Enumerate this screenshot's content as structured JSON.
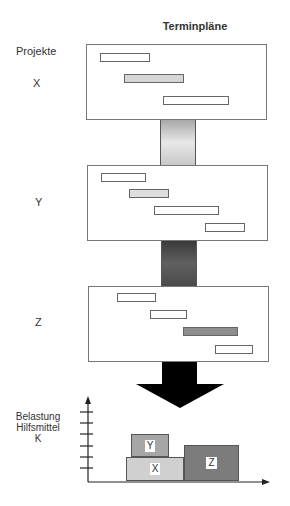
{
  "title": "Terminpläne",
  "projects_label": "Projekte",
  "projects": [
    {
      "name": "X",
      "panel": {
        "x": 86,
        "y": 44,
        "w": 181,
        "h": 76
      },
      "label_pos": {
        "x": 33,
        "y": 77
      },
      "bars": [
        {
          "x": 100,
          "y": 53,
          "w": 50,
          "fill": "#ffffff"
        },
        {
          "x": 124,
          "y": 74,
          "w": 60,
          "fill": "#d6d6d6"
        },
        {
          "x": 163,
          "y": 96,
          "w": 66,
          "fill": "#ffffff"
        }
      ]
    },
    {
      "name": "Y",
      "panel": {
        "x": 87,
        "y": 165,
        "w": 181,
        "h": 76
      },
      "label_pos": {
        "x": 35,
        "y": 196
      },
      "bars": [
        {
          "x": 101,
          "y": 173,
          "w": 45,
          "fill": "#ffffff"
        },
        {
          "x": 129,
          "y": 189,
          "w": 40,
          "fill": "#dedede"
        },
        {
          "x": 154,
          "y": 206,
          "w": 65,
          "fill": "#ffffff"
        },
        {
          "x": 205,
          "y": 223,
          "w": 40,
          "fill": "#ffffff"
        }
      ]
    },
    {
      "name": "Z",
      "panel": {
        "x": 88,
        "y": 286,
        "w": 181,
        "h": 76
      },
      "label_pos": {
        "x": 35,
        "y": 316
      },
      "bars": [
        {
          "x": 117,
          "y": 293,
          "w": 39,
          "fill": "#ffffff"
        },
        {
          "x": 150,
          "y": 310,
          "w": 37,
          "fill": "#ffffff"
        },
        {
          "x": 183,
          "y": 327,
          "w": 55,
          "fill": "#8e8e8e"
        },
        {
          "x": 215,
          "y": 345,
          "w": 38,
          "fill": "#ffffff"
        }
      ]
    }
  ],
  "connectors": [
    {
      "x": 160,
      "y": 120,
      "w": 36,
      "h": 45,
      "gradient": [
        "#a8a8a8",
        "#e8e8e8",
        "#c8c8c8"
      ]
    },
    {
      "x": 161,
      "y": 241,
      "w": 36,
      "h": 45,
      "gradient": [
        "#3a3a3a",
        "#606060",
        "#4a4a4a"
      ]
    }
  ],
  "result_arrow": {
    "color": "#000000"
  },
  "load_chart": {
    "ylabel_lines": [
      "Belastung",
      "Hilfsmittel",
      "K"
    ],
    "blocks": [
      {
        "label": "X",
        "x": 126,
        "y": 457,
        "w": 58,
        "h": 24,
        "fill": "#d0d0d0"
      },
      {
        "label": "Y",
        "x": 131,
        "y": 434,
        "w": 38,
        "h": 23,
        "fill": "#a6a6a6"
      },
      {
        "label": "Z",
        "x": 184,
        "y": 445,
        "w": 55,
        "h": 36,
        "fill": "#7c7c7c"
      }
    ]
  },
  "chart_data": {
    "type": "bar",
    "title": "Belastung Hilfsmittel K",
    "categories": [
      "X+Y period",
      "Z period"
    ],
    "series": [
      {
        "name": "X",
        "values": [
          2,
          0
        ]
      },
      {
        "name": "Y",
        "values": [
          2,
          0
        ]
      },
      {
        "name": "Z",
        "values": [
          0,
          3
        ]
      }
    ],
    "xlabel": "",
    "ylabel": "Belastung Hilfsmittel K",
    "ticks": 6,
    "grid": false
  }
}
